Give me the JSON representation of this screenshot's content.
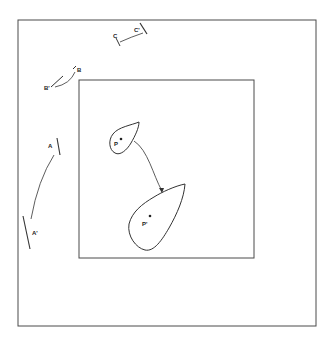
{
  "diagram": {
    "stroke_color": "#4a4a4a",
    "outer_frame": {
      "x": 18,
      "y": 20,
      "w": 298,
      "h": 306
    },
    "inner_frame": {
      "x": 79,
      "y": 80,
      "w": 175,
      "h": 178
    },
    "labels": {
      "A": "A",
      "A_prime": "A'",
      "B": "B",
      "B_prime": "B'",
      "C": "C",
      "C_prime": "C'",
      "P": "P",
      "P_prime": "P'"
    }
  }
}
